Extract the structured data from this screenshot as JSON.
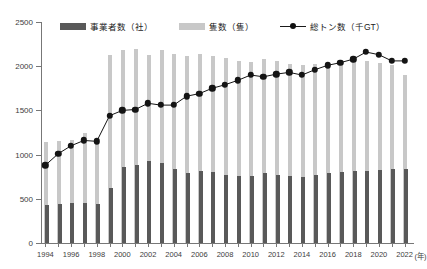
{
  "chart_data": {
    "type": "bar",
    "title": "",
    "xlabel": "(年)",
    "ylabel": "",
    "ylim": [
      0,
      2500
    ],
    "ytick_values": [
      0,
      500,
      1000,
      1500,
      2000,
      2500
    ],
    "ytick_labels": [
      "0",
      "500",
      "1000",
      "1500",
      "2000",
      "2500"
    ],
    "grid": false,
    "legend_position": "top",
    "categories": [
      "1994",
      "1995",
      "1996",
      "1997",
      "1998",
      "1999",
      "2000",
      "2001",
      "2002",
      "2003",
      "2004",
      "2005",
      "2006",
      "2007",
      "2008",
      "2009",
      "2010",
      "2011",
      "2012",
      "2013",
      "2014",
      "2015",
      "2016",
      "2017",
      "2018",
      "2019",
      "2020",
      "2021",
      "2022"
    ],
    "xtick_labels": [
      "1994",
      "",
      "1996",
      "",
      "1998",
      "",
      "2000",
      "",
      "2002",
      "",
      "2004",
      "",
      "2006",
      "",
      "2008",
      "",
      "2010",
      "",
      "2012",
      "",
      "2014",
      "",
      "2016",
      "",
      "2018",
      "",
      "2020",
      "",
      "2022"
    ],
    "series": [
      {
        "name": "事業者数（社）",
        "type": "bar",
        "color": "#595959",
        "values": [
          430,
          445,
          450,
          455,
          440,
          620,
          855,
          880,
          930,
          900,
          840,
          795,
          820,
          805,
          775,
          760,
          755,
          790,
          775,
          760,
          750,
          765,
          790,
          805,
          810,
          820,
          830,
          840,
          835
        ]
      },
      {
        "name": "隻数（隻）",
        "type": "bar",
        "color": "#c8c8c8",
        "values": [
          1140,
          1150,
          1160,
          1250,
          1180,
          2130,
          2180,
          2200,
          2130,
          2180,
          2140,
          2110,
          2140,
          2120,
          2090,
          2060,
          2050,
          2080,
          2060,
          2030,
          2010,
          2020,
          2040,
          2050,
          2060,
          2060,
          2040,
          2010,
          1900
        ]
      },
      {
        "name": "総トン数（千GT）",
        "type": "line",
        "color": "#141414",
        "marker": "circle",
        "values": [
          880,
          1010,
          1100,
          1160,
          1150,
          1440,
          1500,
          1510,
          1580,
          1560,
          1560,
          1660,
          1690,
          1750,
          1790,
          1840,
          1900,
          1880,
          1910,
          1930,
          1900,
          1960,
          2010,
          2040,
          2080,
          2160,
          2130,
          2060,
          2060
        ]
      }
    ]
  },
  "legend": {
    "items": [
      {
        "label": "事業者数（社）",
        "marker": "dark-swatch"
      },
      {
        "label": "隻数（隻）",
        "marker": "light-swatch"
      },
      {
        "label": "総トン数（千GT）",
        "marker": "line-marker"
      }
    ]
  },
  "axis": {
    "x_unit_label": "(年)"
  }
}
